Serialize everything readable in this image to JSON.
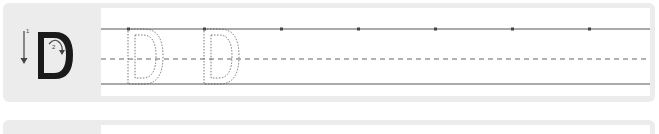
{
  "worksheet": {
    "letter": "D",
    "rows": [
      {
        "model": {
          "letter": "D",
          "strokes": [
            {
              "number": "1",
              "direction": "down"
            },
            {
              "number": "2",
              "direction": "clockwise-curve"
            }
          ]
        },
        "tracing_letters": [
          "D",
          "D"
        ],
        "guide_dots_count": 7
      },
      {
        "model": {
          "letter": ""
        },
        "tracing_letters": []
      }
    ],
    "colors": {
      "panel": "#ececec",
      "paper": "#ffffff",
      "line": "#555555",
      "letter": "#222222"
    }
  }
}
